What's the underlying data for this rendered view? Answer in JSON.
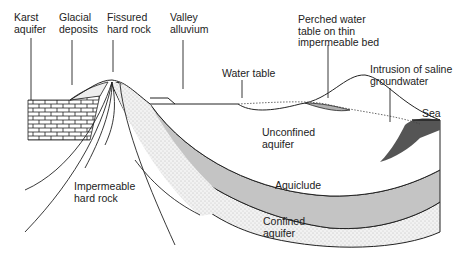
{
  "colors": {
    "line": "#222222",
    "aquiclude": "#c4c4c4",
    "stipple": "#e8e8e8",
    "saline": "#555555",
    "perched": "#b0b0b0"
  },
  "labels": {
    "karst": "Karst\naquifer",
    "glacial": "Glacial\ndeposits",
    "fissured": "Fissured\nhard rock",
    "valley": "Valley\nalluvium",
    "water_table": "Water table",
    "perched": "Perched water\ntable on thin\nimpermeable bed",
    "saline": "Intrusion of saline\ngroundwater",
    "sea": "Sea",
    "unconfined": "Unconfined\naquifer",
    "aquiclude": "Aquiclude",
    "confined": "Confined\naquifer",
    "impermeable": "Impermeable\nhard rock"
  }
}
